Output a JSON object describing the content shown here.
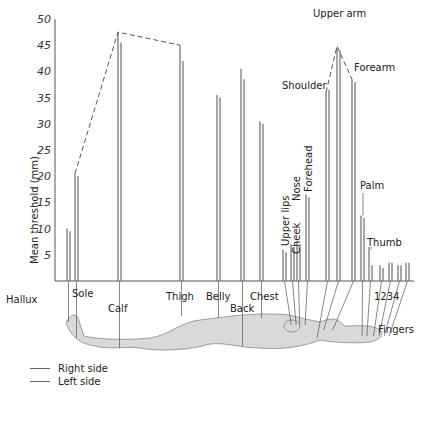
{
  "chart_data": {
    "type": "bar",
    "title": "",
    "xlabel": "",
    "ylabel": "Mean threshold (mm)",
    "ylim": [
      0,
      50
    ],
    "yticks": [
      5,
      10,
      15,
      20,
      25,
      30,
      35,
      40,
      45,
      50
    ],
    "grid": false,
    "legend_position": "bottom-left",
    "categories": [
      "Hallux",
      "Sole",
      "Calf",
      "Thigh",
      "Belly",
      "Back",
      "Chest",
      "Upper lips",
      "Cheek",
      "Nose",
      "Forehead",
      "Shoulder",
      "Upper arm",
      "Forearm",
      "Palm",
      "Thumb",
      "Finger 1",
      "Finger 2",
      "Finger 3",
      "Finger 4"
    ],
    "series": [
      {
        "name": "Right side",
        "values": [
          10,
          20.5,
          47.5,
          45,
          35.5,
          40.5,
          30.5,
          6,
          7,
          7.5,
          16.5,
          36,
          44.5,
          38.5,
          12.5,
          6.5,
          3,
          3.5,
          3,
          3.5
        ]
      },
      {
        "name": "Left side",
        "values": [
          9.5,
          20,
          45.5,
          42,
          35,
          38.5,
          30,
          5.5,
          6.5,
          7,
          16,
          36.5,
          44,
          38,
          12,
          3,
          2.5,
          3.5,
          3,
          3.5
        ]
      }
    ],
    "annotations": [
      "Dashed envelope connecting Sole, Calf, Thigh peaks",
      "Dashed envelope connecting Shoulder, Upper arm, Forearm peaks",
      "Body silhouette with leader lines from each bar to the body region"
    ]
  },
  "labels": {
    "y_axis": "Mean threshold (mm)",
    "hallux": "Hallux",
    "sole": "Sole",
    "calf": "Calf",
    "thigh": "Thigh",
    "belly": "Belly",
    "back": "Back",
    "chest": "Chest",
    "upper_lips": "Upper lips",
    "nose": "Nose",
    "cheek": "Cheek",
    "forehead": "Forehead",
    "shoulder": "Shoulder",
    "upper_arm": "Upper arm",
    "forearm": "Forearm",
    "palm": "Palm",
    "thumb": "Thumb",
    "fingers": "Fingers",
    "finger_numbers": "1234"
  },
  "legend": {
    "right": "Right side",
    "left": "Left side"
  }
}
